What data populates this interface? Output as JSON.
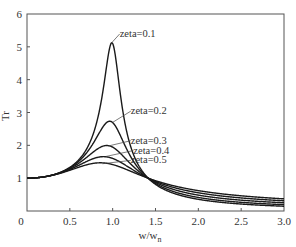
{
  "chart_data": {
    "type": "line",
    "title": "",
    "xlabel": "w/w_n",
    "xlabel_main": "w/w",
    "xlabel_sub": "n",
    "ylabel": "Tr",
    "xlim": [
      0,
      3.0
    ],
    "ylim": [
      0,
      6
    ],
    "grid": false,
    "legend": "inline annotations",
    "x_ticks": [
      "0",
      "0.5",
      "1.0",
      "1.5",
      "2.0",
      "2.5",
      "3.0"
    ],
    "x_tick_values": [
      0,
      0.5,
      1.0,
      1.5,
      2.0,
      2.5,
      3.0
    ],
    "y_ticks": [
      "1",
      "2",
      "3",
      "4",
      "5",
      "6"
    ],
    "y_tick_values": [
      1,
      2,
      3,
      4,
      5,
      6
    ],
    "x": [
      0,
      0.25,
      0.5,
      0.75,
      0.9,
      1.0,
      1.1,
      1.25,
      1.414,
      1.5,
      2.0,
      2.5,
      3.0
    ],
    "series": [
      {
        "name": "zeta=0.1",
        "zeta": 0.1,
        "values": [
          1.0,
          1.07,
          1.33,
          2.26,
          4.11,
          5.1,
          3.89,
          1.75,
          1.0,
          0.82,
          0.36,
          0.22,
          0.16
        ],
        "label_pos": [
          0.98,
          5.1
        ]
      },
      {
        "name": "zeta=0.2",
        "zeta": 0.2,
        "values": [
          1.0,
          1.07,
          1.31,
          2.03,
          2.62,
          2.69,
          2.34,
          1.5,
          1.0,
          0.87,
          0.46,
          0.32,
          0.26
        ],
        "label_pos": [
          1.0,
          2.7
        ]
      },
      {
        "name": "zeta=0.3",
        "zeta": 0.3,
        "values": [
          1.0,
          1.07,
          1.29,
          1.78,
          1.98,
          1.94,
          1.77,
          1.35,
          1.0,
          0.9,
          0.56,
          0.43,
          0.36
        ],
        "label_pos": [
          0.95,
          1.98
        ]
      },
      {
        "name": "zeta=0.4",
        "zeta": 0.4,
        "values": [
          1.0,
          1.06,
          1.26,
          1.56,
          1.65,
          1.6,
          1.49,
          1.24,
          1.0,
          0.93,
          0.65,
          0.53,
          0.46
        ],
        "label_pos": [
          0.92,
          1.66
        ]
      },
      {
        "name": "zeta=0.5",
        "zeta": 0.5,
        "values": [
          1.0,
          1.06,
          1.23,
          1.4,
          1.43,
          1.41,
          1.35,
          1.17,
          1.0,
          0.95,
          0.72,
          0.61,
          0.55
        ],
        "label_pos": [
          0.88,
          1.44
        ]
      }
    ],
    "annotations": [
      {
        "text": "zeta=0.1",
        "x": 1.07,
        "y": 5.3
      },
      {
        "text": "zeta=0.2",
        "x": 1.2,
        "y": 2.95
      },
      {
        "text": "zeta=0.3",
        "x": 1.2,
        "y": 2.05
      },
      {
        "text": "zeta=0.4",
        "x": 1.23,
        "y": 1.75
      },
      {
        "text": "zeta=0.5",
        "x": 1.2,
        "y": 1.45
      }
    ],
    "line_color": "#1a1a1a",
    "axis_color": "#555555"
  }
}
